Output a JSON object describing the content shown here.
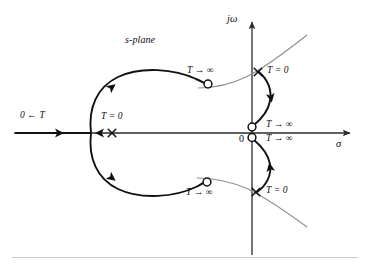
{
  "figure": {
    "type": "root-locus-s-plane-diagram",
    "title": "s-plane",
    "background_color": "#ffffff",
    "locus_color": "#111111",
    "axis_color": "#2b2b2b",
    "asymptote_color": "#8c8c8c",
    "footer_rule_color": "#c9c9c9"
  },
  "axes": {
    "vertical_label": "jω",
    "horizontal_label": "σ",
    "origin_label": "0"
  },
  "labels": {
    "plane": "s-plane",
    "real_axis_branch": "0 ← T",
    "pole_real_axis": "T = 0",
    "pole_upper": "T = 0",
    "pole_lower": "T = 0",
    "zero_upper_left": "T → ∞",
    "zero_lower_left": "T → ∞",
    "zero_origin_upper": "T → ∞",
    "zero_origin_lower": "T → ∞"
  },
  "markers": {
    "poles": [
      {
        "name": "pole-real-axis",
        "glyph": "×",
        "x": 112,
        "y": 133
      },
      {
        "name": "pole-upper-complex",
        "glyph": "×",
        "x": 258,
        "y": 72
      },
      {
        "name": "pole-lower-complex",
        "glyph": "×",
        "x": 256,
        "y": 192
      }
    ],
    "zeros": [
      {
        "name": "zero-upper-left",
        "glyph": "○",
        "x": 208,
        "y": 84
      },
      {
        "name": "zero-lower-left",
        "glyph": "○",
        "x": 207,
        "y": 182
      },
      {
        "name": "zero-origin-upper",
        "glyph": "○",
        "x": 252,
        "y": 127
      },
      {
        "name": "zero-origin-lower",
        "glyph": "○",
        "x": 252,
        "y": 137
      }
    ]
  }
}
